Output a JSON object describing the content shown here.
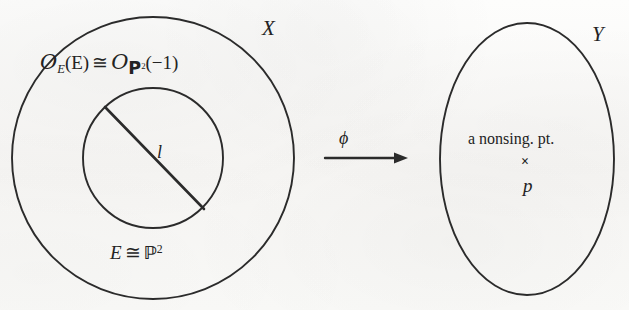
{
  "diagram": {
    "type": "commutative-blowdown-diagram",
    "background_color": "#fbfbfa",
    "ink_color": "#232323"
  },
  "left_region": {
    "outer_label": "X",
    "outer_shape": "circle",
    "outer_center": [
      153,
      158
    ],
    "outer_radius": 141,
    "inner_shape": "circle",
    "inner_center": [
      153,
      158
    ],
    "inner_radius": 70,
    "top_formula": {
      "sheaf_symbol": "O",
      "sheaf_subscript": "E",
      "argument": "(E)",
      "relation": "≅",
      "rhs_sheaf_symbol": "O",
      "rhs_subscript_base": "P",
      "rhs_subscript_exponent": "2",
      "rhs_argument": "(−1)",
      "plain": "𝒪E(E) ≅ 𝒪P2(−1)"
    },
    "bottom_formula": {
      "lhs": "E",
      "relation": "≅",
      "rhs_base": "ℙ",
      "rhs_exponent": "2",
      "plain": "E ≅ ℙ2"
    },
    "chord_label": "l",
    "chord_endpoints": [
      [
        105,
        108
      ],
      [
        202,
        208
      ]
    ]
  },
  "arrow": {
    "label": "ϕ",
    "icon": "arrow-right-icon",
    "x_start": 325,
    "x_end": 408,
    "y": 158
  },
  "right_region": {
    "outer_label": "Y",
    "shape": "ellipse",
    "center": [
      527,
      159
    ],
    "rx": 87,
    "ry": 136,
    "point_caption": "a nonsing. pt.",
    "point_marker": "×",
    "point_label": "p"
  }
}
